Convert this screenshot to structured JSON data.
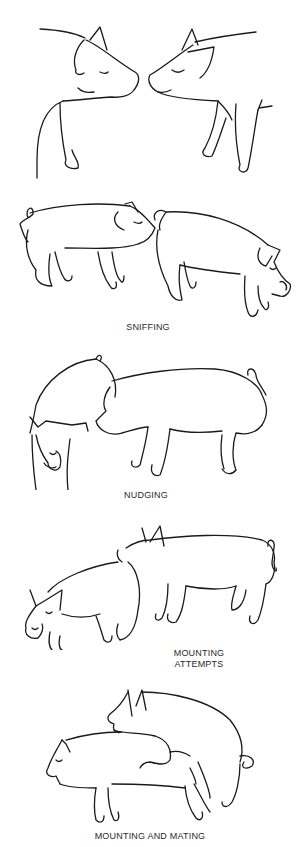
{
  "figure": {
    "panels": [
      {
        "id": "nose-to-nose",
        "label": ""
      },
      {
        "id": "sniffing",
        "label": "SNIFFING"
      },
      {
        "id": "nudging",
        "label": "NUDGING"
      },
      {
        "id": "mounting-attempts",
        "label_lines": [
          "MOUNTING",
          "ATTEMPTS"
        ]
      },
      {
        "id": "mounting-and-mating",
        "label": "MOUNTING AND MATING"
      }
    ],
    "colors": {
      "background": "#ffffff",
      "line": "#1a1a1a",
      "text": "#2a2a2a"
    }
  }
}
